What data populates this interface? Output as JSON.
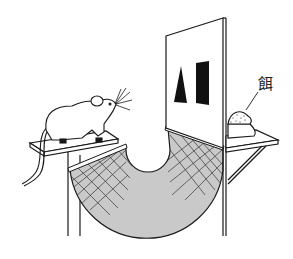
{
  "figure": {
    "labels": {
      "bait": "餌"
    },
    "stimuli": [
      {
        "shape": "triangle",
        "fill": "#111111"
      },
      {
        "shape": "rectangle",
        "fill": "#111111"
      }
    ],
    "colors": {
      "line": "#1a1a1a",
      "net_fill": "#c9c9c9",
      "background": "#ffffff"
    }
  }
}
